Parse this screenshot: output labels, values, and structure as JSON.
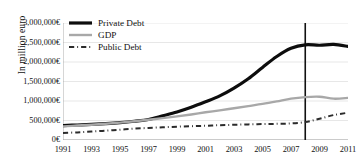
{
  "chart_data": {
    "type": "line",
    "title": "",
    "subtitle": "",
    "xlabel": "",
    "ylabel": "In million euro",
    "xlim": [
      1991,
      2011
    ],
    "ylim": [
      0,
      3000000
    ],
    "grid": true,
    "legend_position": "top-left",
    "x": [
      1991,
      1992,
      1993,
      1994,
      1995,
      1996,
      1997,
      1998,
      1999,
      2000,
      2001,
      2002,
      2003,
      2004,
      2005,
      2006,
      2007,
      2008,
      2009,
      2010,
      2011
    ],
    "xtick_labels": [
      "1991",
      "1993",
      "1995",
      "1997",
      "1999",
      "2001",
      "2003",
      "2005",
      "2007",
      "2009",
      "2011"
    ],
    "xticks": [
      1991,
      1993,
      1995,
      1997,
      1999,
      2001,
      2003,
      2005,
      2007,
      2009,
      2011
    ],
    "yticks": [
      0,
      500000,
      1000000,
      1500000,
      2000000,
      2500000,
      3000000
    ],
    "ytick_labels": [
      "0€",
      "500,000€",
      "1,000,000€",
      "1,500,000€",
      "2,000,000€",
      "2,500,000€",
      "3,000,000€"
    ],
    "series": [
      {
        "name": "Private Debt",
        "style": "solid",
        "color": "#0d0d0d",
        "width": 3.2,
        "values": [
          370000,
          385000,
          400000,
          420000,
          445000,
          480000,
          525000,
          620000,
          720000,
          840000,
          980000,
          1130000,
          1330000,
          1570000,
          1860000,
          2140000,
          2350000,
          2440000,
          2430000,
          2450000,
          2400000
        ]
      },
      {
        "name": "GDP",
        "style": "solid",
        "color": "#a8a8a8",
        "width": 2.4,
        "values": [
          350000,
          370000,
          390000,
          415000,
          445000,
          480000,
          520000,
          560000,
          605000,
          655000,
          710000,
          760000,
          815000,
          870000,
          925000,
          990000,
          1060000,
          1100000,
          1110000,
          1060000,
          1080000
        ]
      },
      {
        "name": "Public Debt",
        "style": "dash-dot",
        "color": "#2b2b2b",
        "width": 2.0,
        "values": [
          180000,
          195000,
          215000,
          240000,
          265000,
          290000,
          310000,
          325000,
          340000,
          355000,
          365000,
          380000,
          390000,
          400000,
          408000,
          415000,
          425000,
          460000,
          545000,
          640000,
          700000
        ]
      }
    ],
    "annotations": [
      {
        "type": "vertical-line",
        "x": 2008,
        "label": "",
        "color": "#111111",
        "width": 1.6
      }
    ]
  },
  "legend": {
    "items": [
      {
        "label": "Private Debt",
        "key": "thick-solid-black-line-icon"
      },
      {
        "label": "GDP",
        "key": "solid-gray-line-icon"
      },
      {
        "label": "Public Debt",
        "key": "dash-dot-line-icon"
      }
    ]
  },
  "axis": {
    "y_title": "In million euro"
  }
}
